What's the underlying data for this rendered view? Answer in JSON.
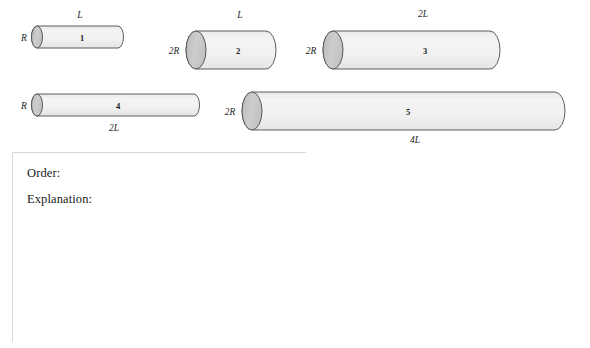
{
  "figure": {
    "caption_present": false,
    "style": {
      "body_fill": "#f2f2f2",
      "cap_fill": "#c9c9c9",
      "outline": "#4a4a4a",
      "text": "#1a1a1a"
    },
    "cylinders": [
      {
        "id": "cylinder-1",
        "number_label": "1",
        "radius_label": "R",
        "length_label": "L",
        "length_label_position": "above",
        "x": 32,
        "y": 37,
        "length": 91,
        "half_height": 11
      },
      {
        "id": "cylinder-2",
        "number_label": "2",
        "radius_label": "2R",
        "length_label": "L",
        "length_label_position": "above",
        "x": 186,
        "y": 31,
        "length": 90,
        "half_height": 19
      },
      {
        "id": "cylinder-3",
        "number_label": "3",
        "radius_label": "2R",
        "length_label": "2L",
        "length_label_position": "above",
        "x": 322,
        "y": 31,
        "length": 178,
        "half_height": 19
      },
      {
        "id": "cylinder-4",
        "number_label": "4",
        "radius_label": "R",
        "length_label": "2L",
        "length_label_position": "below",
        "x": 32,
        "y": 100,
        "length": 168,
        "half_height": 11
      },
      {
        "id": "cylinder-5",
        "number_label": "5",
        "radius_label": "2R",
        "length_label": "4L",
        "length_label_position": "below",
        "x": 241,
        "y": 94,
        "length": 324,
        "half_height": 19
      }
    ]
  },
  "answer": {
    "order_prompt": "Order:",
    "explanation_prompt": "Explanation:"
  }
}
